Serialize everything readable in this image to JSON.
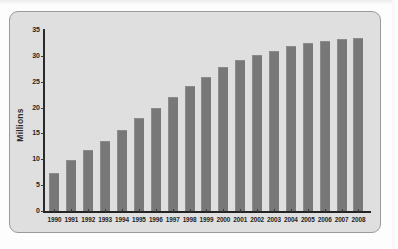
{
  "figure": {
    "axis_label_y": "Millions",
    "colors": {
      "bar": "#787878",
      "plot_background": "#dfdfdf",
      "axis": "#242424",
      "panel_border": "#9a9a9a",
      "page_background": "#fdfdfd"
    }
  },
  "chart_data": {
    "type": "bar",
    "title": "",
    "subtitle": "",
    "xlabel": "",
    "ylabel": "Millions",
    "grid": false,
    "legend": false,
    "ylim": [
      0,
      35
    ],
    "ytick_labels": [
      "35",
      "30",
      "25",
      "20",
      "15",
      "10",
      "5",
      "0"
    ],
    "ytick_values": [
      35,
      30,
      25,
      20,
      15,
      10,
      5,
      0
    ],
    "categories": [
      "1990",
      "1991",
      "1992",
      "1993",
      "1994",
      "1995",
      "1996",
      "1997",
      "1998",
      "1999",
      "2000",
      "2001",
      "2002",
      "2003",
      "2004",
      "2005",
      "2006",
      "2007",
      "2008"
    ],
    "values": [
      7.4,
      9.8,
      11.8,
      13.6,
      15.7,
      18.0,
      20.0,
      22.1,
      24.2,
      26.0,
      27.8,
      29.2,
      30.2,
      31.0,
      31.9,
      32.4,
      32.9,
      33.3,
      33.5
    ]
  }
}
